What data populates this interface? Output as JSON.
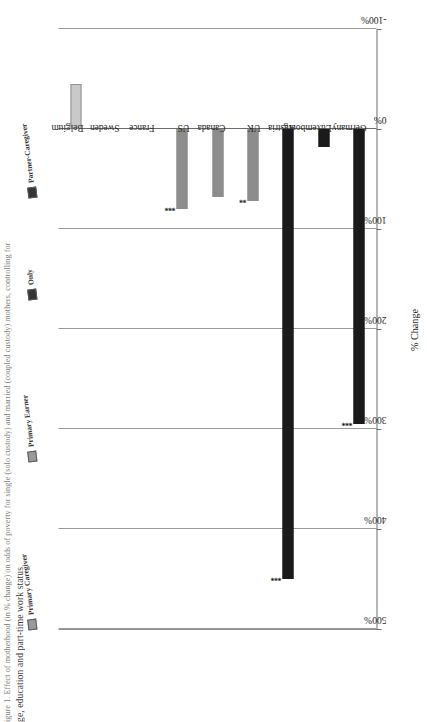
{
  "caption": {
    "line1": "igure 1. Effect of motherhood (in % change) on odds of poverty for single (solo custody) and married (coupled custody) mothers, controlling for",
    "line2": "ge, education and part-time work status"
  },
  "legend": {
    "items": [
      {
        "label": "Primary Caregiver",
        "color": "#8c8c8c"
      },
      {
        "label": "Primary Earner",
        "color": "#8c8c8c"
      },
      {
        "label": "Only",
        "color": "#1a1a1a"
      },
      {
        "label": "Partner-Caregiver",
        "color": "#1a1a1a"
      }
    ]
  },
  "chart_data": {
    "type": "bar",
    "title": "",
    "xlabel": "",
    "ylabel": "% Change",
    "ylim": [
      -100,
      500
    ],
    "yticks": [
      "500%",
      "400%",
      "300%",
      "200%",
      "100%",
      "0%",
      "-100%"
    ],
    "ytick_values": [
      500,
      400,
      300,
      200,
      100,
      0,
      -100
    ],
    "grid": true,
    "orientation": "vertical-printed-sideways",
    "categories": [
      "Germany",
      "Luxembourg",
      "Austria",
      "UK",
      "Canada",
      "US",
      "France",
      "Sweden",
      "Belgium"
    ],
    "values": [
      295,
      18,
      450,
      72,
      68,
      80,
      0,
      0,
      -45
    ],
    "colors": [
      "#1a1a1a",
      "#1a1a1a",
      "#1a1a1a",
      "#8c8c8c",
      "#8c8c8c",
      "#8c8c8c",
      "#c9c9c9",
      "#c9c9c9",
      "#c9c9c9"
    ],
    "significance": [
      "***",
      "",
      "***",
      "**",
      "",
      "***",
      "",
      "",
      ""
    ]
  }
}
